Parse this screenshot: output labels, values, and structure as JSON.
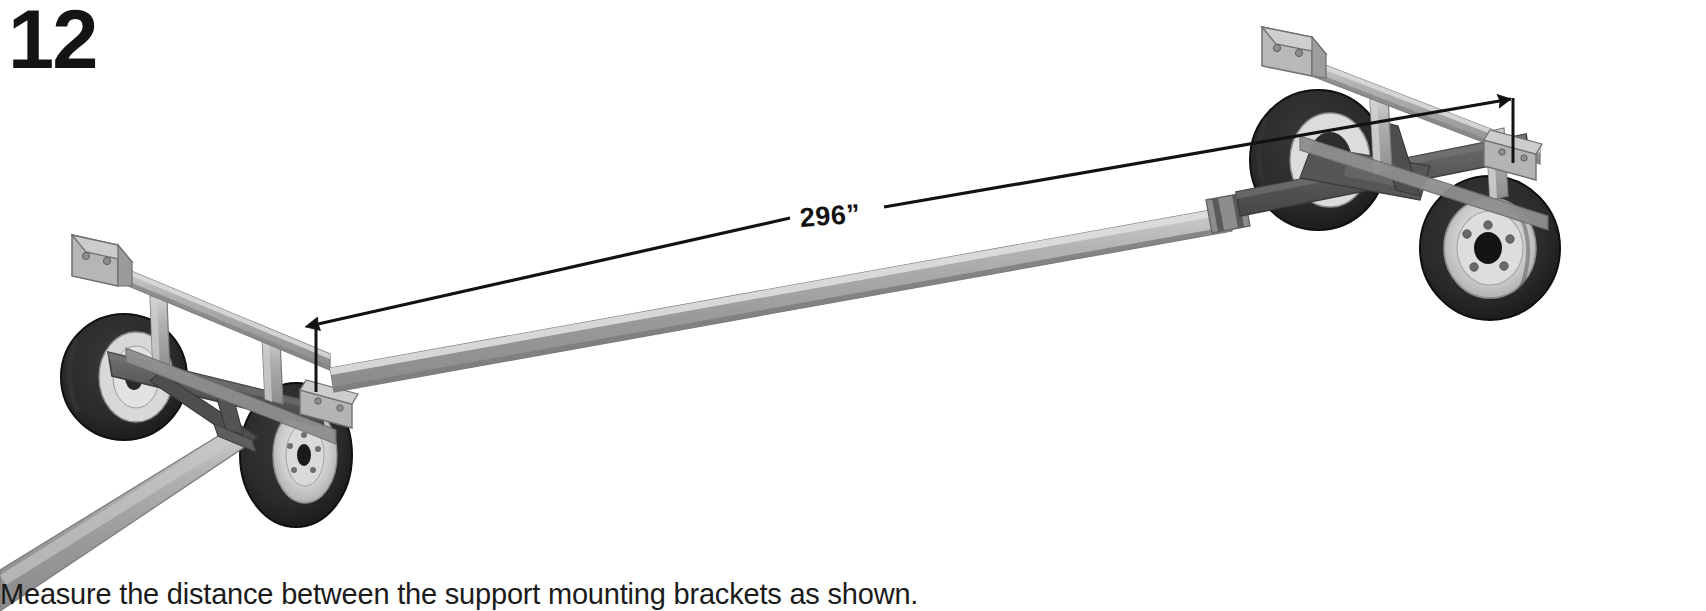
{
  "step": {
    "number": "12",
    "caption": "Measure the distance between the support mounting brackets as shown."
  },
  "dimension": {
    "label": "296”",
    "value": 296,
    "unit": "inches",
    "measures": "distance between support mounting brackets",
    "arrow_style": "double-headed with extension lines",
    "start_point": "left support mounting bracket",
    "end_point": "right support mounting bracket"
  },
  "illustration": {
    "subject": "boat trailer / bunk support dolly frame, isometric view",
    "components": [
      "left axle assembly with two wheels",
      "right axle assembly with two wheels",
      "long center tube / main frame beam",
      "left support mounting bracket (angle bracket, 2 bolt holes)",
      "right support mounting bracket (angle bracket, 2 bolt holes)",
      "left upright post",
      "right upright post",
      "drawbar / tongue extending lower-left off frame",
      "coupler collar on center beam"
    ],
    "wheel_count": 4,
    "view": "isometric line art, grayscale"
  },
  "colors": {
    "background": "#ffffff",
    "ink": "#121212",
    "steel_light": "#c4c4c4",
    "steel_mid": "#9a9a9a",
    "steel_dark": "#6b6b6b",
    "frame_dark": "#585858",
    "tire": "#2b2b2b",
    "tire_shade": "#1d1d1d",
    "rim": "#d2d2d2",
    "hub": "#151515"
  }
}
